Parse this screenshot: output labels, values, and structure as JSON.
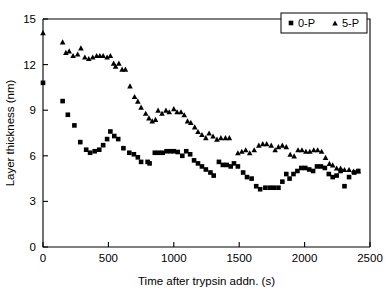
{
  "chart_data": {
    "type": "scatter",
    "title": "",
    "xlabel": "Time after trypsin addn. (s)",
    "ylabel": "Layer thickness (nm)",
    "xlim": [
      0,
      2500
    ],
    "ylim": [
      0,
      15
    ],
    "xticks": [
      0,
      500,
      1000,
      1500,
      2000,
      2500
    ],
    "yticks": [
      0,
      3,
      6,
      9,
      12,
      15
    ],
    "grid": false,
    "legend_position": "top-right",
    "series": [
      {
        "name": "0-P",
        "marker": "square",
        "color": "#000000",
        "points": [
          [
            0,
            10.8
          ],
          [
            150,
            9.6
          ],
          [
            190,
            8.7
          ],
          [
            240,
            8.0
          ],
          [
            285,
            6.9
          ],
          [
            330,
            6.4
          ],
          [
            360,
            6.2
          ],
          [
            395,
            6.3
          ],
          [
            430,
            6.4
          ],
          [
            460,
            6.7
          ],
          [
            490,
            7.1
          ],
          [
            515,
            7.6
          ],
          [
            545,
            7.3
          ],
          [
            575,
            7.1
          ],
          [
            615,
            6.5
          ],
          [
            660,
            6.2
          ],
          [
            695,
            6.1
          ],
          [
            725,
            5.9
          ],
          [
            750,
            5.6
          ],
          [
            800,
            5.6
          ],
          [
            815,
            5.5
          ],
          [
            855,
            6.2
          ],
          [
            885,
            6.2
          ],
          [
            915,
            6.2
          ],
          [
            945,
            6.3
          ],
          [
            975,
            6.3
          ],
          [
            1000,
            6.3
          ],
          [
            1030,
            6.25
          ],
          [
            1065,
            6.0
          ],
          [
            1095,
            6.3
          ],
          [
            1125,
            6.1
          ],
          [
            1155,
            5.7
          ],
          [
            1185,
            5.5
          ],
          [
            1215,
            5.3
          ],
          [
            1245,
            5.1
          ],
          [
            1280,
            4.9
          ],
          [
            1305,
            4.7
          ],
          [
            1345,
            5.6
          ],
          [
            1375,
            5.4
          ],
          [
            1405,
            5.4
          ],
          [
            1435,
            5.3
          ],
          [
            1460,
            5.5
          ],
          [
            1490,
            5.3
          ],
          [
            1530,
            4.9
          ],
          [
            1560,
            4.6
          ],
          [
            1595,
            4.5
          ],
          [
            1630,
            4.0
          ],
          [
            1660,
            3.8
          ],
          [
            1700,
            3.9
          ],
          [
            1735,
            3.9
          ],
          [
            1765,
            3.9
          ],
          [
            1800,
            3.9
          ],
          [
            1830,
            4.3
          ],
          [
            1860,
            4.8
          ],
          [
            1885,
            4.5
          ],
          [
            1915,
            4.8
          ],
          [
            1945,
            5.0
          ],
          [
            1975,
            5.2
          ],
          [
            2005,
            5.2
          ],
          [
            2035,
            5.1
          ],
          [
            2065,
            5.0
          ],
          [
            2095,
            5.3
          ],
          [
            2125,
            5.3
          ],
          [
            2155,
            5.2
          ],
          [
            2185,
            4.8
          ],
          [
            2215,
            4.6
          ],
          [
            2245,
            4.7
          ],
          [
            2275,
            5.0
          ],
          [
            2305,
            4.0
          ],
          [
            2340,
            4.6
          ],
          [
            2380,
            4.9
          ],
          [
            2410,
            5.0
          ]
        ]
      },
      {
        "name": "5-P",
        "marker": "triangle",
        "color": "#000000",
        "points": [
          [
            0,
            14.1
          ],
          [
            150,
            13.5
          ],
          [
            175,
            12.8
          ],
          [
            200,
            12.9
          ],
          [
            230,
            12.6
          ],
          [
            265,
            12.7
          ],
          [
            290,
            13.1
          ],
          [
            320,
            12.5
          ],
          [
            350,
            12.4
          ],
          [
            380,
            12.5
          ],
          [
            410,
            12.6
          ],
          [
            435,
            12.6
          ],
          [
            460,
            12.6
          ],
          [
            490,
            12.5
          ],
          [
            515,
            12.6
          ],
          [
            540,
            12.1
          ],
          [
            555,
            11.9
          ],
          [
            580,
            12.1
          ],
          [
            605,
            11.7
          ],
          [
            630,
            11.7
          ],
          [
            665,
            10.6
          ],
          [
            700,
            9.9
          ],
          [
            725,
            9.6
          ],
          [
            750,
            9.2
          ],
          [
            785,
            8.8
          ],
          [
            810,
            8.5
          ],
          [
            835,
            8.3
          ],
          [
            860,
            8.4
          ],
          [
            880,
            9.0
          ],
          [
            910,
            8.8
          ],
          [
            940,
            9.0
          ],
          [
            965,
            8.9
          ],
          [
            1000,
            9.1
          ],
          [
            1025,
            8.9
          ],
          [
            1055,
            8.9
          ],
          [
            1080,
            8.7
          ],
          [
            1105,
            8.3
          ],
          [
            1130,
            8.2
          ],
          [
            1160,
            7.9
          ],
          [
            1185,
            7.6
          ],
          [
            1215,
            7.4
          ],
          [
            1245,
            7.2
          ],
          [
            1270,
            7.5
          ],
          [
            1300,
            7.3
          ],
          [
            1330,
            7.1
          ],
          [
            1360,
            7.2
          ],
          [
            1395,
            7.2
          ],
          [
            1425,
            7.2
          ],
          [
            1490,
            6.2
          ],
          [
            1520,
            6.3
          ],
          [
            1550,
            6.4
          ],
          [
            1580,
            6.2
          ],
          [
            1615,
            6.4
          ],
          [
            1650,
            6.7
          ],
          [
            1680,
            6.8
          ],
          [
            1710,
            6.8
          ],
          [
            1745,
            6.7
          ],
          [
            1775,
            6.4
          ],
          [
            1800,
            6.6
          ],
          [
            1830,
            6.7
          ],
          [
            1860,
            6.6
          ],
          [
            1890,
            6.1
          ],
          [
            1920,
            6.0
          ],
          [
            1950,
            6.4
          ],
          [
            1980,
            6.4
          ],
          [
            2010,
            6.3
          ],
          [
            2040,
            6.3
          ],
          [
            2070,
            6.4
          ],
          [
            2100,
            6.4
          ],
          [
            2130,
            6.3
          ],
          [
            2160,
            5.9
          ],
          [
            2190,
            5.5
          ],
          [
            2215,
            5.4
          ],
          [
            2245,
            5.2
          ],
          [
            2275,
            5.2
          ],
          [
            2305,
            5.1
          ],
          [
            2340,
            5.1
          ],
          [
            2375,
            5.0
          ],
          [
            2410,
            5.0
          ]
        ]
      }
    ]
  },
  "legend": {
    "items": [
      {
        "label": "0-P",
        "marker": "square"
      },
      {
        "label": "5-P",
        "marker": "triangle"
      }
    ]
  },
  "axes": {
    "x_title": "Time after trypsin addn. (s)",
    "y_title": "Layer thickness (nm)",
    "x_tick_labels": [
      "0",
      "500",
      "1000",
      "1500",
      "2000",
      "2500"
    ],
    "y_tick_labels": [
      "0",
      "3",
      "6",
      "9",
      "12",
      "15"
    ]
  }
}
